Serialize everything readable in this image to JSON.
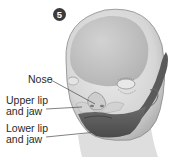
{
  "figure": {
    "step_badge": "5",
    "labels": {
      "nose": "Nose",
      "upper_lip_line1": "Upper lip",
      "upper_lip_line2": "and jaw",
      "lower_lip_line1": "Lower lip",
      "lower_lip_line2": "and jaw"
    },
    "colors": {
      "background": "#ffffff",
      "skin_light": "#e6e6e6",
      "skin_mid": "#cfcfcf",
      "skin_dark": "#b5b5b5",
      "forehead_region": "#bdbdbd",
      "lower_jaw_region": "#5e5e5e",
      "outline": "#6a6a6a",
      "text": "#2a2a2a",
      "badge": "#3a3a3a"
    }
  }
}
